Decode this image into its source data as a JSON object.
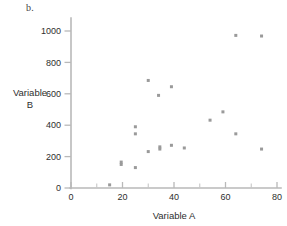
{
  "figure": {
    "panel_label": "b.",
    "background_color": "#ffffff",
    "point_color": "#9a9a9a",
    "axis_color": "#b9b9b9",
    "text_color": "#2e2e2e"
  },
  "chart_data": {
    "type": "scatter",
    "title": "",
    "xlabel": "Variable A",
    "ylabel_line1": "Variable",
    "ylabel_line2": "B",
    "ylabel": "Variable B",
    "xlim": [
      0,
      80
    ],
    "ylim": [
      0,
      1000
    ],
    "xticks": [
      0,
      20,
      40,
      60,
      80
    ],
    "xticks_minor": [
      10,
      30,
      50,
      70
    ],
    "yticks": [
      0,
      200,
      400,
      600,
      800,
      1000
    ],
    "xtick_labels": [
      "0",
      "20",
      "40",
      "60",
      "80"
    ],
    "ytick_labels": [
      "0",
      "200",
      "400",
      "600",
      "800",
      "1000"
    ],
    "grid": false,
    "legend": null,
    "marker": "square",
    "marker_size": 3,
    "points": [
      {
        "x": 15,
        "y": 20
      },
      {
        "x": 19.5,
        "y": 165
      },
      {
        "x": 19.5,
        "y": 150
      },
      {
        "x": 25,
        "y": 130
      },
      {
        "x": 25,
        "y": 390
      },
      {
        "x": 25,
        "y": 345
      },
      {
        "x": 30,
        "y": 232
      },
      {
        "x": 30,
        "y": 685
      },
      {
        "x": 34,
        "y": 590
      },
      {
        "x": 34.5,
        "y": 262
      },
      {
        "x": 34.5,
        "y": 248
      },
      {
        "x": 39,
        "y": 645
      },
      {
        "x": 39,
        "y": 272
      },
      {
        "x": 44,
        "y": 255
      },
      {
        "x": 54,
        "y": 432
      },
      {
        "x": 59,
        "y": 485
      },
      {
        "x": 64,
        "y": 972
      },
      {
        "x": 64,
        "y": 345
      },
      {
        "x": 74,
        "y": 968
      },
      {
        "x": 74,
        "y": 248
      }
    ]
  }
}
